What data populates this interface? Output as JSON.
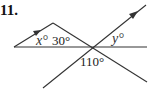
{
  "problem": {
    "number": "11."
  },
  "labels": {
    "x_angle": "x°",
    "angle_30": "30°",
    "y_angle": "y°",
    "angle_110": "110°"
  },
  "colors": {
    "line": "#333333",
    "background": "#ffffff"
  }
}
